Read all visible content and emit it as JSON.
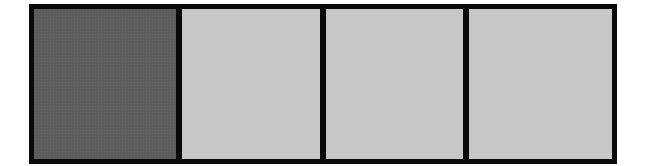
{
  "diagram": {
    "type": "segmented-bar",
    "segment_count": 4,
    "filled_count": 1,
    "segments": [
      {
        "index": 1,
        "state": "filled",
        "color": "#5c5c5c",
        "width": 142
      },
      {
        "index": 2,
        "state": "empty",
        "color": "#d2d2d2",
        "width": 138
      },
      {
        "index": 3,
        "state": "empty",
        "color": "#d2d2d2",
        "width": 137
      },
      {
        "index": 4,
        "state": "empty",
        "color": "#d2d2d2",
        "width": 143
      }
    ],
    "border_color": "#0a0a0a",
    "background": "#ffffff"
  }
}
